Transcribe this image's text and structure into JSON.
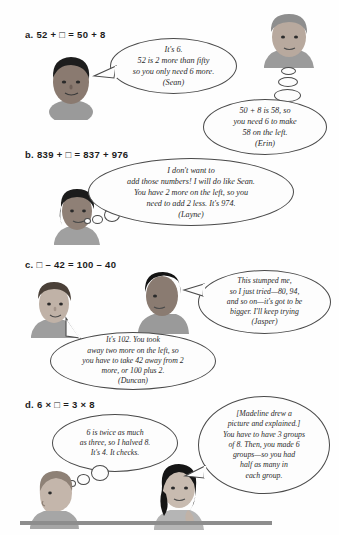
{
  "page": {
    "background_color": "#fefefe",
    "rule_color": "#8d8d8d"
  },
  "problems": [
    {
      "id": "a",
      "equation": "a. 52 + □ = 50 + 8",
      "bubbles": [
        {
          "speaker": "Sean",
          "kind": "speech",
          "text": "It's 6.\n52 is 2 more than fifty\nso you only need 6 more.\n(Sean)"
        },
        {
          "speaker": "Erin",
          "kind": "thought",
          "text": "50 + 8 is 58, so\nyou need 6 to make\n58 on the left.\n(Erin)"
        }
      ]
    },
    {
      "id": "b",
      "equation": "b. 839 + □ = 837 + 976",
      "bubbles": [
        {
          "speaker": "Layne",
          "kind": "thought",
          "text": "I don't want to\nadd those numbers! I will do like Sean.\nYou have 2 more on the left, so you\nneed to add 2 less. It's 974.\n(Layne)"
        }
      ]
    },
    {
      "id": "c",
      "equation": "c. □ – 42 = 100 – 40",
      "bubbles": [
        {
          "speaker": "Jasper",
          "kind": "speech",
          "text": "This stumped me,\nso I just tried—80, 94,\nand so on—it's got to be\nbigger. I'll keep trying\n(Jasper)"
        },
        {
          "speaker": "Duncan",
          "kind": "speech",
          "text": "It's 102. You took\naway two more on the left, so\nyou have to take 42 away from 2\nmore, or 100 plus 2.\n(Duncan)"
        }
      ]
    },
    {
      "id": "d",
      "equation": "d. 6 × □ = 3 × 8",
      "bubbles": [
        {
          "speaker": "unnamed-boy",
          "kind": "thought",
          "text": "6 is twice as much\nas three, so I halved 8.\nIt's 4. It checks."
        },
        {
          "speaker": "Madeline",
          "kind": "speech",
          "text": "[Madeline drew a\npicture and explained.]\nYou have to have 3 groups\nof 8. Then, you made 6\ngroups—so you had\nhalf as many in\neach group."
        }
      ]
    }
  ]
}
